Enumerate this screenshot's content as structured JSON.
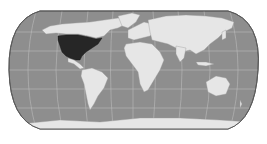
{
  "map": {
    "projection": "Robinson-like world map",
    "colors": {
      "background": "#ffffff",
      "ocean": "#8e8e8e",
      "land": "#e6e6e6",
      "highlight": "#262626",
      "graticule": "#c8c8c8",
      "border": "#5a5a5a"
    },
    "highlighted_region": "North America (United States and Mexico)",
    "graticule": true,
    "labels": []
  }
}
